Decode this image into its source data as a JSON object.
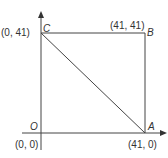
{
  "diagram": {
    "points": {
      "C": {
        "label": "C",
        "coord": "(0, 41)"
      },
      "B": {
        "label": "B",
        "coord": "(41, 41)"
      },
      "O": {
        "label": "O",
        "coord": "(0, 0)"
      },
      "A": {
        "label": "A",
        "coord": "(41, 0)"
      }
    },
    "line_color": "#444444"
  }
}
